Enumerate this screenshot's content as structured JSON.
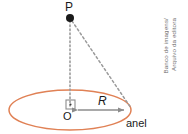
{
  "figure": {
    "type": "physics-diagram",
    "background_color": "#ffffff",
    "labels": {
      "point_p": "P",
      "center_o": "O",
      "radius": "R",
      "ring": "anel"
    },
    "colors": {
      "ring_stroke": "#E08155",
      "guide_line": "#9a9a9a",
      "arrow": "#8c8c8c",
      "point_fill": "#1a1a1a",
      "text": "#1a1a1a",
      "credit_text": "#6e6e6e"
    },
    "geometry": {
      "ring_center_x": 70,
      "ring_center_y": 110,
      "ring_radius_x": 61,
      "ring_radius_y": 20,
      "point_p_x": 70,
      "point_p_y": 18,
      "point_p_dot_radius": 4,
      "ring_edge_x": 131,
      "ring_edge_y": 110,
      "right_angle_box_size": 9
    }
  },
  "credit": {
    "line1": "Banco de imagens/",
    "line2": "Arquivo da editora"
  }
}
